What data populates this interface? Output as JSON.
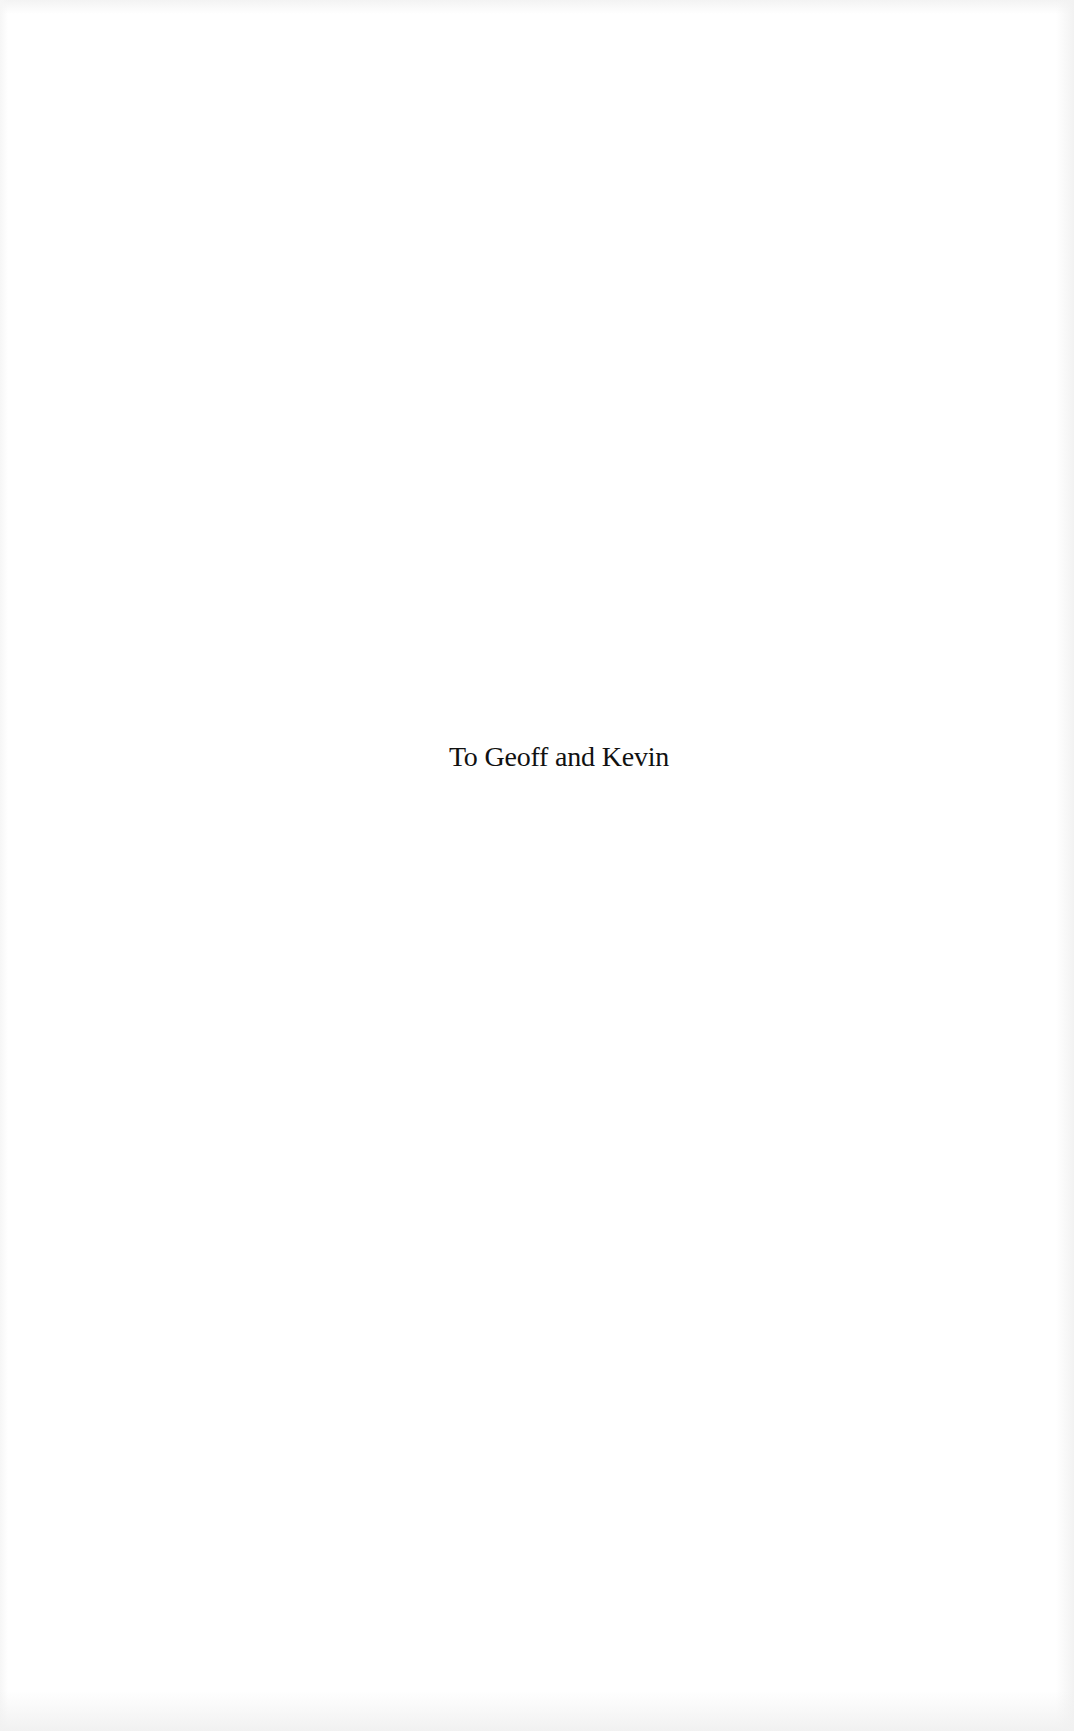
{
  "page": {
    "type": "dedication",
    "dedication_text": "To Geoff and Kevin"
  },
  "colors": {
    "background": "#ffffff",
    "text": "#111111"
  }
}
